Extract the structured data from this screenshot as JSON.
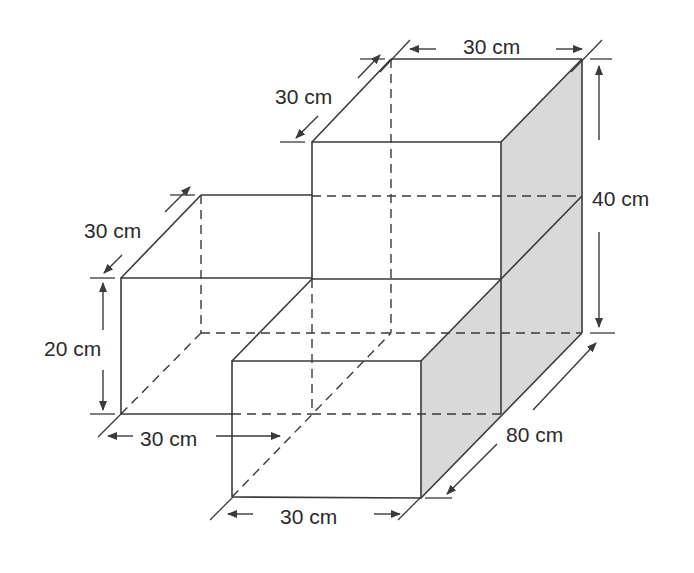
{
  "diagram": {
    "type": "isometric-solid",
    "colors": {
      "edge": "#3a3a3a",
      "shaded_face": "#d9d9d9",
      "background": "#ffffff"
    },
    "labels": {
      "tall_block_top_width": "30 cm",
      "tall_block_top_depth": "30 cm",
      "total_height": "40 cm",
      "left_block_depth": "30 cm",
      "left_block_height": "20 cm",
      "left_block_width": "30 cm",
      "total_length": "80 cm",
      "front_block_width": "30 cm"
    }
  }
}
